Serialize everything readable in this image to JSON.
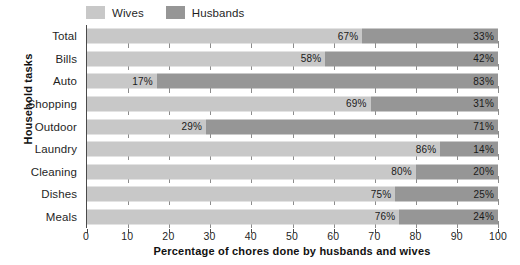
{
  "chart_data": {
    "type": "bar",
    "subtype": "stacked-horizontal-100pct",
    "title": "",
    "xlabel": "Percentage of chores done by husbands and wives",
    "ylabel": "Household tasks",
    "xlim": [
      0,
      100
    ],
    "xticks": [
      0,
      10,
      20,
      30,
      40,
      50,
      60,
      70,
      80,
      90,
      100
    ],
    "xticklabels": [
      "0",
      "10",
      "20",
      "30",
      "40",
      "50",
      "60",
      "70",
      "80",
      "90",
      "100"
    ],
    "grid": true,
    "legend_position": "top-left",
    "categories": [
      "Total",
      "Bills",
      "Auto",
      "Shopping",
      "Outdoor",
      "Laundry",
      "Cleaning",
      "Dishes",
      "Meals"
    ],
    "series": [
      {
        "name": "Wives",
        "color": "#c8c8c8",
        "values": [
          67,
          58,
          17,
          69,
          29,
          86,
          80,
          75,
          76
        ],
        "labels": [
          "67%",
          "58%",
          "17%",
          "69%",
          "29%",
          "86%",
          "80%",
          "75%",
          "76%"
        ]
      },
      {
        "name": "Husbands",
        "color": "#969696",
        "values": [
          33,
          42,
          83,
          31,
          71,
          14,
          20,
          25,
          24
        ],
        "labels": [
          "33%",
          "42%",
          "83%",
          "31%",
          "71%",
          "14%",
          "20%",
          "25%",
          "24%"
        ]
      }
    ]
  },
  "legend": {
    "items": [
      {
        "label": "Wives",
        "color": "#c8c8c8"
      },
      {
        "label": "Husbands",
        "color": "#969696"
      }
    ]
  },
  "axes": {
    "y_title": "Household tasks",
    "x_title": "Percentage of chores done by husbands and wives"
  }
}
